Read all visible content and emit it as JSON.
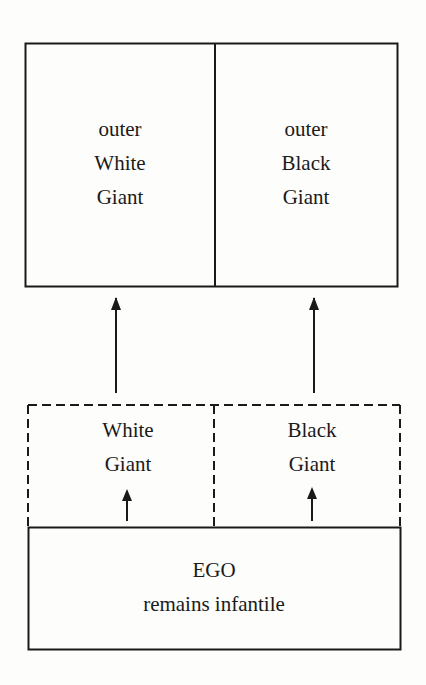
{
  "diagram": {
    "outer_box": {
      "left": {
        "lines": [
          "outer",
          "White",
          "Giant"
        ]
      },
      "right": {
        "lines": [
          "outer",
          "Black",
          "Giant"
        ]
      }
    },
    "inner_box": {
      "left": {
        "lines": [
          "White",
          "Giant"
        ]
      },
      "right": {
        "lines": [
          "Black",
          "Giant"
        ]
      },
      "border_style": "dashed"
    },
    "ego_box": {
      "lines": [
        "EGO",
        "remains infantile"
      ]
    },
    "arrows": [
      {
        "from": "inner-white-giant",
        "to": "outer-white-giant"
      },
      {
        "from": "inner-black-giant",
        "to": "outer-black-giant"
      },
      {
        "from": "ego",
        "to": "inner-white-giant"
      },
      {
        "from": "ego",
        "to": "inner-black-giant"
      }
    ],
    "colors": {
      "line": "#1a1a1a",
      "background": "#fdfdfb"
    }
  }
}
